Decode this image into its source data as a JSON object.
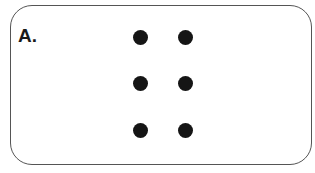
{
  "panel": {
    "label": "A.",
    "dot_color": "#151515",
    "border_color": "#555555",
    "dots": [
      {
        "row": 1,
        "col": 1,
        "x": 140,
        "y": 37
      },
      {
        "row": 1,
        "col": 2,
        "x": 185,
        "y": 37
      },
      {
        "row": 2,
        "col": 1,
        "x": 140,
        "y": 83
      },
      {
        "row": 2,
        "col": 2,
        "x": 185,
        "y": 83
      },
      {
        "row": 3,
        "col": 1,
        "x": 140,
        "y": 130
      },
      {
        "row": 3,
        "col": 2,
        "x": 185,
        "y": 130
      }
    ]
  }
}
